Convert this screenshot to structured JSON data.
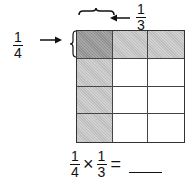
{
  "diagram": {
    "row_label": {
      "numerator": "1",
      "denominator": "4"
    },
    "col_label": {
      "numerator": "1",
      "denominator": "3"
    },
    "grid": {
      "rows": 4,
      "cols": 3,
      "shading": [
        [
          "dark",
          "light",
          "light"
        ],
        [
          "light",
          "none",
          "none"
        ],
        [
          "light",
          "none",
          "none"
        ],
        [
          "light",
          "none",
          "none"
        ]
      ]
    },
    "equation": {
      "left": {
        "numerator": "1",
        "denominator": "4"
      },
      "operator": "×",
      "right": {
        "numerator": "1",
        "denominator": "3"
      },
      "equals": "=",
      "answer": ""
    }
  }
}
